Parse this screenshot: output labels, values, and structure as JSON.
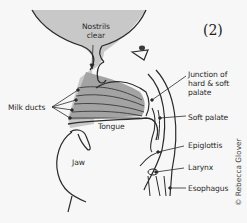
{
  "figure": {
    "number": "(2)",
    "credit": "© Rebecca Glover",
    "colors": {
      "background": "#f7f7f7",
      "shaded_region": "#c4c4c4",
      "tongue_fill": "#9a9a9a",
      "line": "#2b2b2b"
    },
    "labels": {
      "nostrils": [
        "Nostrils",
        "clear"
      ],
      "junction": [
        "Junction of",
        "hard & soft",
        "palate"
      ],
      "milk_ducts": "Milk ducts",
      "soft_palate": "Soft palate",
      "tongue": "Tongue",
      "epiglottis": "Epiglottis",
      "jaw": "Jaw",
      "larynx": "Larynx",
      "esophagus": "Esophagus"
    }
  }
}
